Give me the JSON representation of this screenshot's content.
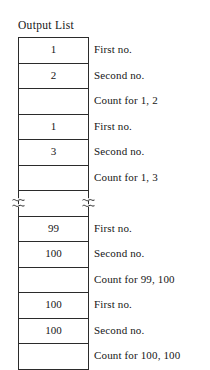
{
  "figure": {
    "title": "Output List",
    "caption_labels": {
      "first": "First no.",
      "second": "Second no."
    },
    "break_marker_icon": "line-break-squiggle-icon",
    "rows": [
      {
        "value": "1",
        "label": "First no.",
        "type": "value"
      },
      {
        "value": "2",
        "label": "Second no.",
        "type": "value"
      },
      {
        "value": "",
        "label": "Count for 1, 2",
        "type": "count"
      },
      {
        "value": "1",
        "label": "First no.",
        "type": "value"
      },
      {
        "value": "3",
        "label": "Second no.",
        "type": "value"
      },
      {
        "value": "",
        "label": "Count for 1, 3",
        "type": "count"
      },
      {
        "value": "",
        "label": "",
        "type": "break"
      },
      {
        "value": "99",
        "label": "First no.",
        "type": "value"
      },
      {
        "value": "100",
        "label": "Second no.",
        "type": "value"
      },
      {
        "value": "",
        "label": "Count for 99, 100",
        "type": "count"
      },
      {
        "value": "100",
        "label": "First no.",
        "type": "value"
      },
      {
        "value": "100",
        "label": "Second no.",
        "type": "value"
      },
      {
        "value": "",
        "label": "Count for 100, 100",
        "type": "count"
      }
    ],
    "colors": {
      "background": "#ffffff",
      "line": "#2b2b2b",
      "text": "#161616"
    }
  }
}
